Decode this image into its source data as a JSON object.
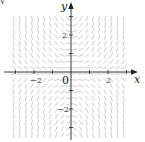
{
  "figure": {
    "type": "direction-field",
    "corner_mark": "v",
    "axes": {
      "x_label": "x",
      "y_label": "y",
      "origin_label": "0",
      "x_tick_labels": [
        {
          "value": -2,
          "label": "−2"
        },
        {
          "value": 2,
          "label": "2"
        }
      ],
      "y_tick_labels": [
        {
          "value": 2,
          "label": "2"
        },
        {
          "value": -2,
          "label": "−2"
        }
      ],
      "x_ticks": [
        -3,
        -2,
        -1,
        1,
        2,
        3
      ],
      "y_ticks": [
        -3,
        -2,
        -1,
        1,
        2,
        3
      ],
      "x_range": [
        -3.5,
        3.1
      ],
      "y_range": [
        -3.5,
        3.1
      ]
    },
    "field": {
      "description": "slope field, steep in quadrants I and III (positive), negative in II and IV, flat near axes",
      "x_extent": [
        -3.1,
        3.1
      ],
      "y_extent": [
        -3.4,
        3.1
      ],
      "spacing": 0.33,
      "segment_length": 0.26,
      "color": "#b8b8b8"
    },
    "colors": {
      "axis": "#222222",
      "field": "#b8b8b8"
    }
  }
}
